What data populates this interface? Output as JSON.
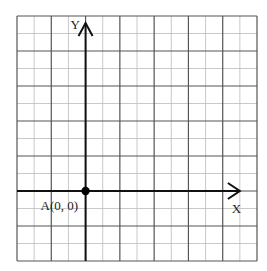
{
  "diagram": {
    "type": "coordinate-plane",
    "x_range": [
      -2,
      5
    ],
    "y_range": [
      -2,
      5
    ],
    "major_step": 1,
    "minor_step": 0.5,
    "x_axis": {
      "label": "X",
      "arrow_end": 4.5
    },
    "y_axis": {
      "label": "Y",
      "arrow_end": 4.8
    },
    "points": [
      {
        "name": "A",
        "x": 0,
        "y": 0,
        "label": "A(0, 0)"
      }
    ],
    "colors": {
      "major_grid": "#555555",
      "minor_grid": "#bbbbbb",
      "axis": "#111111",
      "point": "#000000"
    }
  }
}
